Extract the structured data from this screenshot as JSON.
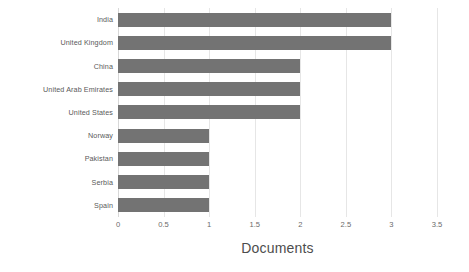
{
  "chart_data": {
    "type": "bar",
    "orientation": "horizontal",
    "title": "",
    "subtitle": "",
    "xlabel": "Documents",
    "ylabel": "",
    "categories": [
      "India",
      "United Kingdom",
      "China",
      "United Arab Emirates",
      "United States",
      "Norway",
      "Pakistan",
      "Serbia",
      "Spain"
    ],
    "values": [
      3,
      3,
      2,
      2,
      2,
      1,
      1,
      1,
      1
    ],
    "xticks": [
      "0",
      "0.5",
      "1",
      "1.5",
      "2",
      "2.5",
      "3",
      "3.5"
    ],
    "xtick_values": [
      0,
      0.5,
      1,
      1.5,
      2,
      2.5,
      3,
      3.5
    ],
    "xlim": [
      0,
      3.5
    ],
    "grid": "vertical",
    "legend": "none",
    "bar_color": "#737373",
    "grid_color": "#e6e6e6",
    "background_color": "#ffffff",
    "label_color": "#5a5a5a",
    "axis_title_color": "#4d4d4d"
  }
}
